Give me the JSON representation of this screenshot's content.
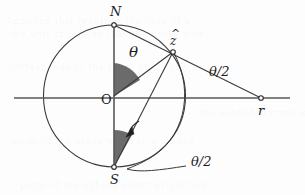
{
  "figure": {
    "background_color": "#fdfdfd",
    "stroke_color": "#3a3a3a",
    "wedge_fill": "#6b6b6b",
    "width": 305,
    "height": 195
  },
  "points": {
    "north": {
      "label": "N",
      "x": 114,
      "y": 25
    },
    "south": {
      "label": "S",
      "x": 114,
      "y": 167
    },
    "origin": {
      "label": "O",
      "x": 114,
      "y": 96
    },
    "zhat": {
      "label": "z",
      "accent": "^",
      "x": 173,
      "y": 52
    },
    "r": {
      "label": "r",
      "x": 261,
      "y": 98
    }
  },
  "angles": {
    "theta": {
      "label": "θ",
      "x": 129,
      "y": 51
    },
    "theta_half_right": {
      "label": "θ/2",
      "x": 209,
      "y": 71
    },
    "theta_half_bottom": {
      "label": "θ/2",
      "x": 191,
      "y": 161
    }
  },
  "geometry": {
    "circle": {
      "cx": 114.5,
      "cy": 96,
      "r": 71
    },
    "axis": {
      "x1": 14,
      "y1": 98,
      "x2": 290,
      "y2": 98
    },
    "vertical_axis": {
      "x1": 114,
      "y1": 22,
      "x2": 114,
      "y2": 170
    }
  },
  "ghost_text": {
    "lines": [
      "Applying this result to the case of a",
      "the unit sphere so that the north pole",
      "corresponds to the point at infinity in",
      "the extended complex plane and each",
      "point of the plane maps to a unique",
      "point of the sphere under projection"
    ]
  }
}
